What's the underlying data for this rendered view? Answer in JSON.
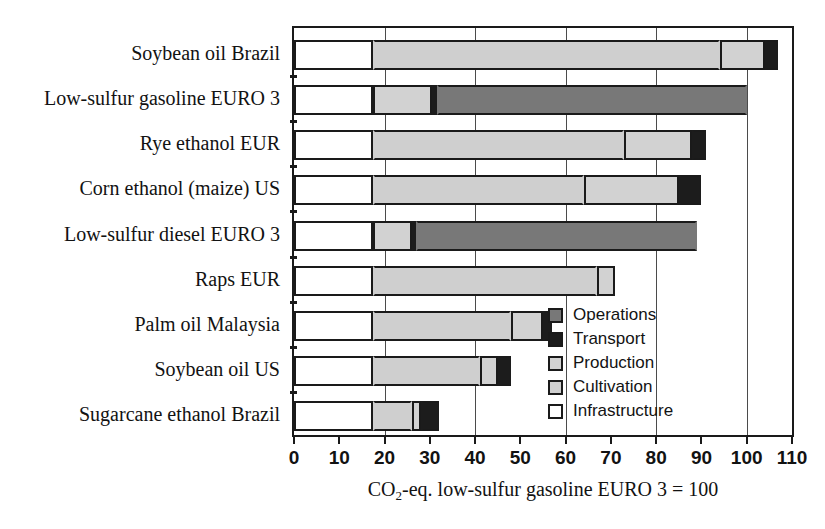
{
  "chart_data": {
    "type": "bar",
    "orientation": "horizontal",
    "stacked": true,
    "title": "",
    "xlabel": "CO2-eq. low-sulfur gasoline EURO 3 = 100",
    "ylabel": "",
    "xlim": [
      0,
      110
    ],
    "xticks": [
      0,
      10,
      20,
      30,
      40,
      50,
      60,
      70,
      80,
      90,
      100,
      110
    ],
    "xtick_labels": [
      "0",
      "10",
      "20",
      "30",
      "40",
      "50",
      "60",
      "70",
      "80",
      "90",
      "100",
      "110"
    ],
    "gridlines_x": [
      20,
      40,
      60,
      80,
      100
    ],
    "grid": true,
    "legend_position": "inside-right",
    "categories": [
      "Soybean oil Brazil",
      "Low-sulfur gasoline EURO 3",
      "Rye ethanol EUR",
      "Corn ethanol (maize) US",
      "Low-sulfur diesel EURO 3",
      "Raps EUR",
      "Palm oil Malaysia",
      "Soybean oil US",
      "Sugarcane ethanol Brazil"
    ],
    "series": [
      {
        "name": "Infrastructure",
        "color": "#ffffff",
        "values": [
          17.5,
          17.5,
          17.5,
          17.5,
          17.5,
          17.5,
          17.5,
          17.5,
          17.5
        ]
      },
      {
        "name": "Cultivation",
        "color": "#cfcfcf",
        "values": [
          76.5,
          0,
          55.5,
          46.5,
          0,
          49.5,
          30.5,
          23.5,
          8.5
        ]
      },
      {
        "name": "Production",
        "color": "#d2d2d2",
        "values": [
          10.0,
          13.0,
          15.0,
          21.0,
          8.5,
          4.0,
          7.0,
          4.0,
          2.0
        ]
      },
      {
        "name": "Transport",
        "color": "#1c1c1c",
        "values": [
          3.0,
          1.0,
          3.0,
          5.0,
          1.0,
          0,
          2.0,
          3.0,
          4.0
        ]
      },
      {
        "name": "Operations",
        "color": "#787878",
        "values": [
          0,
          68.5,
          0,
          0,
          62.0,
          0,
          0,
          0,
          0
        ]
      }
    ],
    "totals": [
      107,
      100,
      91,
      90,
      89,
      71,
      57,
      48,
      32
    ],
    "legend_entries": [
      {
        "label": "Operations",
        "color": "#787878"
      },
      {
        "label": "Transport",
        "color": "#1c1c1c"
      },
      {
        "label": "Production",
        "color": "#d2d2d2"
      },
      {
        "label": "Cultivation",
        "color": "#cfcfcf"
      },
      {
        "label": "Infrastructure",
        "color": "#ffffff"
      }
    ]
  },
  "axis": {
    "title_prefix": "CO",
    "title_sub": "2",
    "title_suffix": "-eq. low-sulfur gasoline EURO 3 = 100"
  }
}
